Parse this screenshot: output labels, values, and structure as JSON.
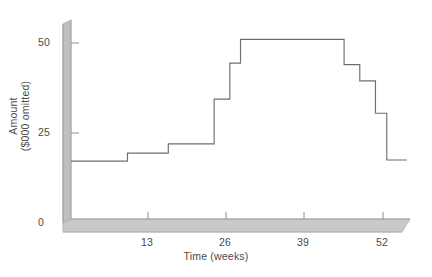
{
  "figure": {
    "background": "#ffffff",
    "line_color": "#6b6b6b",
    "axis_fill": "#bdbdbd",
    "axis_edge": "#9a9a9a",
    "text_color": "#4a4a4a"
  },
  "axes": {
    "y_title_line1": "Amount",
    "y_title_line2": "($000 omitted)",
    "x_title": "Time (weeks)",
    "y_ticks": [
      "0",
      "25",
      "50"
    ],
    "x_ticks": [
      "13",
      "26",
      "39",
      "52"
    ]
  },
  "chart_data": {
    "type": "line",
    "style": "step-post",
    "title": "",
    "xlabel": "Time (weeks)",
    "ylabel": "Amount ($000 omitted)",
    "xlim": [
      0,
      54
    ],
    "ylim": [
      0,
      55
    ],
    "yticks": [
      0,
      25,
      50
    ],
    "xticks": [
      13,
      26,
      39,
      52
    ],
    "grid": false,
    "legend": null,
    "units": "$000 omitted",
    "series": [
      {
        "name": "Amount",
        "x": [
          0,
          9.0,
          15.5,
          22.8,
          25.3,
          27.0,
          43.5,
          46.0,
          48.5,
          50.3,
          53.5
        ],
        "values": [
          17.2,
          19.4,
          22.0,
          34.4,
          44.4,
          51.0,
          51.0,
          44.0,
          39.5,
          30.5,
          17.5
        ],
        "steps": [
          {
            "from_week": 0.0,
            "to_week": 9.0,
            "amount": 17.2
          },
          {
            "from_week": 9.0,
            "to_week": 15.5,
            "amount": 19.4
          },
          {
            "from_week": 15.5,
            "to_week": 22.8,
            "amount": 22.0
          },
          {
            "from_week": 22.8,
            "to_week": 25.3,
            "amount": 34.4
          },
          {
            "from_week": 25.3,
            "to_week": 27.0,
            "amount": 44.4
          },
          {
            "from_week": 27.0,
            "to_week": 43.5,
            "amount": 51.0
          },
          {
            "from_week": 43.5,
            "to_week": 46.0,
            "amount": 44.0
          },
          {
            "from_week": 46.0,
            "to_week": 48.5,
            "amount": 39.5
          },
          {
            "from_week": 48.5,
            "to_week": 50.3,
            "amount": 30.5
          },
          {
            "from_week": 50.3,
            "to_week": 53.5,
            "amount": 17.5
          }
        ]
      }
    ]
  }
}
